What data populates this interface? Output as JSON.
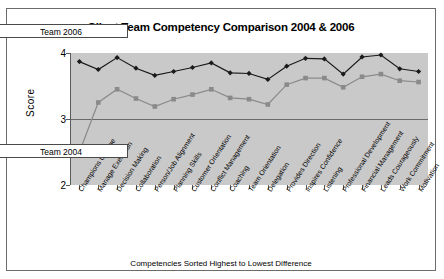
{
  "chart_data": {
    "type": "line",
    "title": "Client Team Competency Comparison 2004 & 2006",
    "xlabel": "Competencies Sorted Highest to Lowest Difference",
    "ylabel": "Score",
    "ylim": [
      2,
      4
    ],
    "yticks": [
      "2",
      "3",
      "4"
    ],
    "grid": true,
    "legend_position": "left-floating-boxes",
    "categories": [
      "Champions Change",
      "Manage Execution",
      "Decision Making",
      "Collaboration",
      "Person/Job Alignment",
      "Planning Skills",
      "Customer Orientation",
      "Conflict Management",
      "Coaching",
      "Team Orientation",
      "Delegation",
      "Provides Direction",
      "Inspires Confidence",
      "Listening",
      "Professional Development",
      "Financial Management",
      "Leads Courageously",
      "Work Commitment",
      "Motivation"
    ],
    "series": [
      {
        "name": "Team 2006",
        "color": "#1a1a1a",
        "marker": "diamond",
        "values": [
          3.87,
          3.75,
          3.93,
          3.77,
          3.66,
          3.72,
          3.78,
          3.85,
          3.7,
          3.69,
          3.6,
          3.8,
          3.92,
          3.91,
          3.68,
          3.94,
          3.97,
          3.76,
          3.72
        ]
      },
      {
        "name": "Team 2004",
        "color": "#8a8a8a",
        "marker": "square",
        "values": [
          2.5,
          3.25,
          3.45,
          3.31,
          3.19,
          3.3,
          3.37,
          3.45,
          3.32,
          3.3,
          3.22,
          3.52,
          3.62,
          3.62,
          3.48,
          3.64,
          3.68,
          3.58,
          3.56
        ]
      }
    ]
  },
  "legend": {
    "series_2006_label": "Team 2006",
    "series_2004_label": "Team 2004"
  },
  "colors": {
    "plot_background": "#c9c9c9",
    "frame": "#6b6b6b",
    "series_2006": "#1a1a1a",
    "series_2004": "#8a8a8a"
  }
}
